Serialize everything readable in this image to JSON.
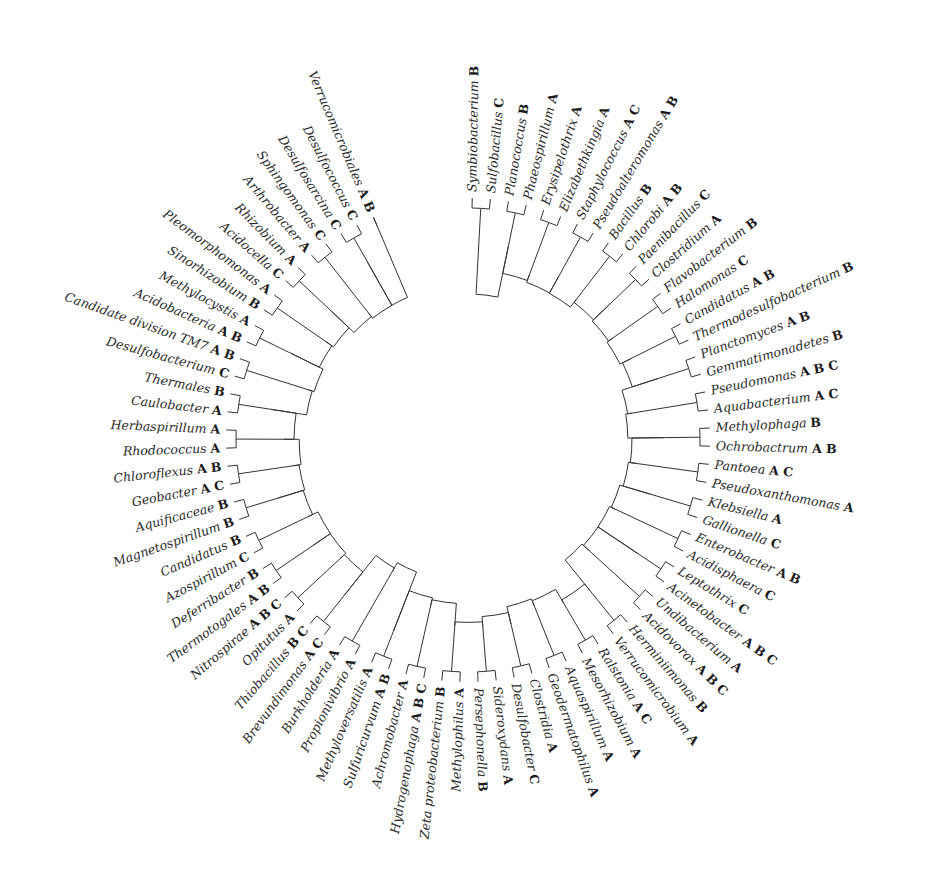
{
  "figure": {
    "type": "circular-phylogenetic-tree",
    "center": [
      468,
      440
    ],
    "colors": {
      "branch": "#333333",
      "label": "#2a2a2a",
      "background": "#ffffff"
    },
    "leaves": [
      {
        "name": "Symbiobacterium",
        "groups": "B"
      },
      {
        "name": "Sulfobacillus",
        "groups": "C"
      },
      {
        "name": "Planococcus",
        "groups": "B"
      },
      {
        "name": "Phaeospirillum",
        "groups": "A"
      },
      {
        "name": "Erysipelothrix",
        "groups": "A"
      },
      {
        "name": "Elizabethkingia",
        "groups": "A"
      },
      {
        "name": "Staphylococcus",
        "groups": "A C"
      },
      {
        "name": "Pseudoalteromonas",
        "groups": "A B"
      },
      {
        "name": "Bacillus",
        "groups": "B"
      },
      {
        "name": "Chlorobi",
        "groups": "A B"
      },
      {
        "name": "Paenibacillus",
        "groups": "C"
      },
      {
        "name": "Clostridium",
        "groups": "A"
      },
      {
        "name": "Flavobacterium",
        "groups": "B"
      },
      {
        "name": "Halomonas",
        "groups": "C"
      },
      {
        "name": "Candidatus",
        "groups": "A B"
      },
      {
        "name": "Thermodesulfobacterium",
        "groups": "B"
      },
      {
        "name": "Planctomyces",
        "groups": "A B"
      },
      {
        "name": "Gemmatimonadetes",
        "groups": "B"
      },
      {
        "name": "Pseudomonas",
        "groups": "A B C"
      },
      {
        "name": "Aquabacterium",
        "groups": "A C"
      },
      {
        "name": "Methylophaga",
        "groups": "B"
      },
      {
        "name": "Ochrobactrum",
        "groups": "A B"
      },
      {
        "name": "Pantoea",
        "groups": "A C"
      },
      {
        "name": "Pseudoxanthomonas",
        "groups": "A"
      },
      {
        "name": "Klebsiella",
        "groups": "A"
      },
      {
        "name": "Gallionella",
        "groups": "C"
      },
      {
        "name": "Enterobacter",
        "groups": "A B"
      },
      {
        "name": "Acidisphaera",
        "groups": "C"
      },
      {
        "name": "Leptothrix",
        "groups": "C"
      },
      {
        "name": "Acinetobacter",
        "groups": "A B C"
      },
      {
        "name": "Undibacterium",
        "groups": "A"
      },
      {
        "name": "Acidovorax",
        "groups": "A B C"
      },
      {
        "name": "Herminiimonas",
        "groups": "B"
      },
      {
        "name": "Verrucomicrobium",
        "groups": "A"
      },
      {
        "name": "Ralstonia",
        "groups": "A C"
      },
      {
        "name": "Mesorhizobium",
        "groups": "A"
      },
      {
        "name": "Aquaspirillum",
        "groups": "A"
      },
      {
        "name": "Geodermatophilus",
        "groups": "A"
      },
      {
        "name": "Clostridia",
        "groups": "A"
      },
      {
        "name": "Desulfobacter",
        "groups": "C"
      },
      {
        "name": "Sideroxydans",
        "groups": "A"
      },
      {
        "name": "Persephonella",
        "groups": "B"
      },
      {
        "name": "Methylophilus",
        "groups": "A"
      },
      {
        "name": "Zeta proteobacterium",
        "groups": "B"
      },
      {
        "name": "Hydrogenophaga",
        "groups": "A B C"
      },
      {
        "name": "Achromobacter",
        "groups": "A"
      },
      {
        "name": "Sulfuricurvum",
        "groups": "A B"
      },
      {
        "name": "Methyloversatilis",
        "groups": "A"
      },
      {
        "name": "Propionivibrio",
        "groups": "A"
      },
      {
        "name": "Burkholderia",
        "groups": "A"
      },
      {
        "name": "Brevundimonas",
        "groups": "A C"
      },
      {
        "name": "Thiobacillus",
        "groups": "B C"
      },
      {
        "name": "Opitutus",
        "groups": "A"
      },
      {
        "name": "Nitrospirae",
        "groups": "A B C"
      },
      {
        "name": "Thermotogales",
        "groups": "A B"
      },
      {
        "name": "Deferribacter",
        "groups": "B"
      },
      {
        "name": "Azospirillum",
        "groups": "C"
      },
      {
        "name": "Candidatus",
        "groups": "B"
      },
      {
        "name": "Magnetospirillum",
        "groups": "B"
      },
      {
        "name": "Aquificaceae",
        "groups": "B"
      },
      {
        "name": "Geobacter",
        "groups": "A C"
      },
      {
        "name": "Chloroflexus",
        "groups": "A B"
      },
      {
        "name": "Rhodococcus",
        "groups": "A"
      },
      {
        "name": "Herbaspirillum",
        "groups": "A"
      },
      {
        "name": "Caulobacter",
        "groups": "A"
      },
      {
        "name": "Thermales",
        "groups": "B"
      },
      {
        "name": "Desulfobacterium",
        "groups": "C"
      },
      {
        "name": "Candidate division TM7",
        "groups": "A B"
      },
      {
        "name": "Acidobacteria",
        "groups": "A B"
      },
      {
        "name": "Methylocystis",
        "groups": "A"
      },
      {
        "name": "Sinorhizobium",
        "groups": "B"
      },
      {
        "name": "Pleomorphomonas",
        "groups": "A"
      },
      {
        "name": "Acidocella",
        "groups": "C"
      },
      {
        "name": "Rhizobium",
        "groups": "A"
      },
      {
        "name": "Arthrobacter",
        "groups": "A"
      },
      {
        "name": "Sphingomonas",
        "groups": "C"
      },
      {
        "name": "Desulfosarcina",
        "groups": "C"
      },
      {
        "name": "Desulfococcus",
        "groups": "C"
      },
      {
        "name": "Verrucomicrobiales",
        "groups": "A B"
      }
    ],
    "caption": ""
  }
}
